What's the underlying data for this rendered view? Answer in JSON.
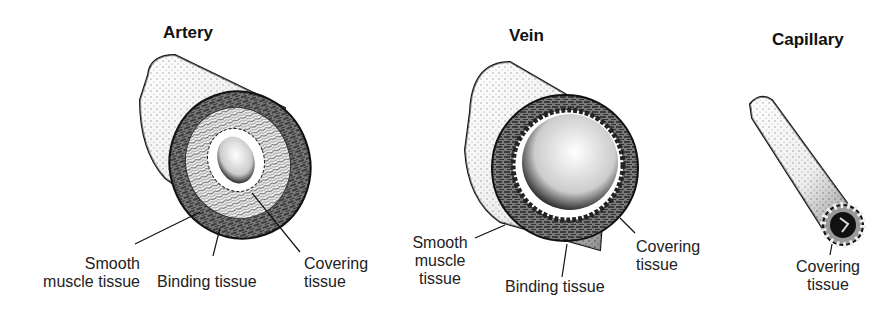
{
  "diagram": {
    "vessels": [
      {
        "name": "Artery",
        "labels": [
          {
            "text": "Smooth muscle tissue",
            "line1": "Smooth",
            "line2": "muscle tissue"
          },
          {
            "text": "Binding tissue"
          },
          {
            "text": "Covering tissue",
            "line1": "Covering",
            "line2": "tissue"
          }
        ]
      },
      {
        "name": "Vein",
        "labels": [
          {
            "text": "Smooth muscle tissue",
            "line1": "Smooth",
            "line2": "muscle",
            "line3": "tissue"
          },
          {
            "text": "Binding tissue"
          },
          {
            "text": "Covering tissue",
            "line1": "Covering",
            "line2": "tissue"
          }
        ]
      },
      {
        "name": "Capillary",
        "labels": [
          {
            "text": "Covering tissue",
            "line1": "Covering",
            "line2": "tissue"
          }
        ]
      }
    ],
    "colors": {
      "ink": "#111111",
      "muscle_layer": "#6e6e6e",
      "background": "#ffffff"
    }
  }
}
